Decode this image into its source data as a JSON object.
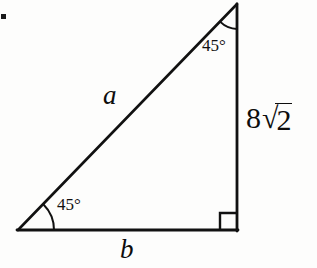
{
  "figure": {
    "type": "geometry-diagram",
    "shape": "right-triangle",
    "background_color": "#fdfdfc",
    "stroke_color": "#111111",
    "width": 317,
    "height": 268
  },
  "vertices": {
    "apex": {
      "x": 237,
      "y": 4
    },
    "bottom_left": {
      "x": 18,
      "y": 230
    },
    "bottom_right": {
      "x": 237,
      "y": 230
    }
  },
  "labels": {
    "hypotenuse": "a",
    "base": "b",
    "vertical_leg_coefficient": "8",
    "vertical_leg_radical_sign": "√",
    "vertical_leg_radicand": "2",
    "vertical_leg_full": "8√2",
    "angle_top": "45°",
    "angle_bottom_left": "45°",
    "right_angle_symbol": "∟"
  },
  "geometry": {
    "angle_top_degrees": 45,
    "angle_bottom_left_degrees": 45,
    "angle_bottom_right_degrees": 90,
    "vertical_leg_length": "8√2",
    "hypotenuse_length_variable": "a",
    "base_length_variable": "b"
  },
  "marks": {
    "arc_apex_radius": 25,
    "arc_bottom_left_radius": 36,
    "right_angle_box_size": 17,
    "scan_artifact": "▪"
  }
}
